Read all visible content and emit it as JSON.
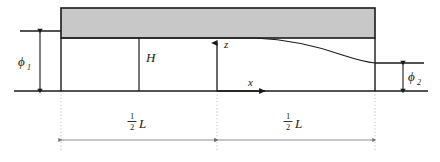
{
  "figure": {
    "kind": "channel-flow-schematic",
    "width": 440,
    "height": 162,
    "background": "#ffffff"
  },
  "colors": {
    "line": "#1a1a1a",
    "block_fill": "#c8c8c8",
    "block_stroke": "#1a1a1a",
    "guide": "#b4b4b4",
    "dimension": "#8c8c8c",
    "thin_line": "#3c3c3c"
  },
  "labels": {
    "phi1": "ϕ",
    "phi1_sub": "1",
    "phi2": "ϕ",
    "phi2_sub": "2",
    "height": "H",
    "z_axis": "z",
    "x_axis": "x",
    "half_L_left_num": "1",
    "half_L_left_den": "2",
    "half_L_left_var": "L",
    "half_L_right_num": "1",
    "half_L_right_den": "2",
    "half_L_right_var": "L"
  },
  "geometry": {
    "baseline_y": 91,
    "block_top_y": 8,
    "block_bottom_y": 38,
    "block_left_x": 61,
    "block_right_x": 375,
    "inner_left_x": 61,
    "inner_right_x": 375,
    "H_line_x": 139,
    "origin_x": 217,
    "right_level_y": 63,
    "upper_ref_y": 31,
    "dimension_line_y": 140,
    "dim_left_x": 61,
    "dim_mid_x": 217,
    "dim_right_x": 375,
    "phi1_arrow_x": 40,
    "phi2_arrow_x": 403,
    "curve_start_x": 255,
    "curve_end_x": 375
  }
}
